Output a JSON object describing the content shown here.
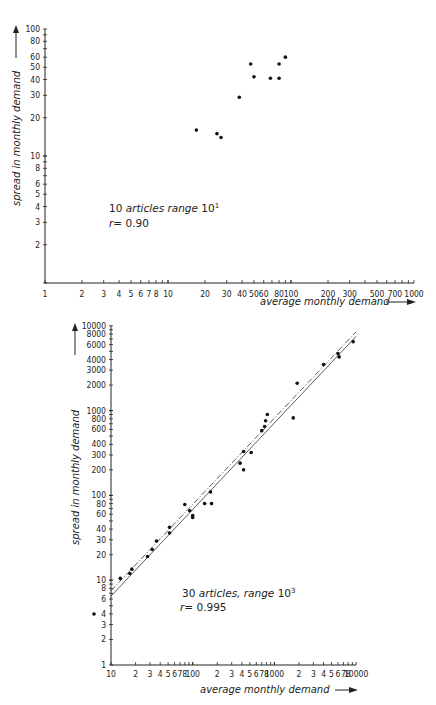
{
  "chart_data": [
    {
      "type": "scatter",
      "scale": "log-log",
      "xlabel": "average monthly demand",
      "ylabel": "spread in monthly demand",
      "xlim": [
        1,
        1000
      ],
      "ylim": [
        1,
        100
      ],
      "x_tick_labels": [
        "1",
        "2",
        "3",
        "4",
        "5",
        "6",
        "7",
        "8",
        "10",
        "20",
        "30",
        "40",
        "50",
        "60",
        "80",
        "100",
        "200",
        "300",
        "500",
        "700",
        "1000"
      ],
      "y_tick_labels": [
        "2",
        "3",
        "4",
        "5",
        "6",
        "8",
        "10",
        "20",
        "30",
        "40",
        "50",
        "60",
        "80",
        "100"
      ],
      "annotation": {
        "count": "10",
        "articles_text": "articles range",
        "range": "10",
        "range_exp": "1",
        "r_label": "r",
        "r_value": "= 0.90"
      },
      "grid": false,
      "points": [
        {
          "x": 17,
          "y": 16
        },
        {
          "x": 25,
          "y": 15
        },
        {
          "x": 27,
          "y": 14
        },
        {
          "x": 38,
          "y": 29
        },
        {
          "x": 47,
          "y": 53
        },
        {
          "x": 50,
          "y": 42
        },
        {
          "x": 68,
          "y": 41
        },
        {
          "x": 80,
          "y": 41
        },
        {
          "x": 80,
          "y": 53
        },
        {
          "x": 90,
          "y": 60
        }
      ]
    },
    {
      "type": "scatter",
      "scale": "log-log",
      "xlabel": "average monthly demand",
      "ylabel": "spread in monthly demand",
      "xlim": [
        10,
        10000
      ],
      "ylim": [
        1,
        10000
      ],
      "x_tick_labels": [
        "10",
        "2",
        "3",
        "4",
        "5",
        "6",
        "7",
        "8",
        "100",
        "2",
        "3",
        "4",
        "5",
        "6",
        "7",
        "8",
        "1000",
        "2",
        "3",
        "4",
        "5",
        "6",
        "7",
        "8",
        "10000"
      ],
      "y_tick_labels": [
        "1",
        "2",
        "3",
        "4",
        "6",
        "8",
        "10",
        "20",
        "30",
        "40",
        "60",
        "80",
        "100",
        "200",
        "300",
        "400",
        "600",
        "800",
        "1000",
        "2000",
        "3000",
        "4000",
        "6000",
        "8000",
        "10000"
      ],
      "annotation": {
        "count": "30",
        "articles_text": "articles, range",
        "range": "10",
        "range_exp": "3",
        "r_label": "r",
        "r_value": "= 0.995"
      },
      "grid": false,
      "fit_lines": [
        {
          "style": "solid",
          "from": {
            "x": 10,
            "y": 6.5
          },
          "to": {
            "x": 10000,
            "y": 7500
          }
        },
        {
          "style": "dashed",
          "from": {
            "x": 10,
            "y": 7.5
          },
          "to": {
            "x": 10000,
            "y": 8500
          }
        }
      ],
      "points": [
        {
          "x": 6,
          "y": 4
        },
        {
          "x": 13,
          "y": 10.5
        },
        {
          "x": 17,
          "y": 12
        },
        {
          "x": 18,
          "y": 13.5
        },
        {
          "x": 28,
          "y": 19
        },
        {
          "x": 32,
          "y": 23
        },
        {
          "x": 36,
          "y": 29
        },
        {
          "x": 52,
          "y": 36
        },
        {
          "x": 52,
          "y": 42
        },
        {
          "x": 80,
          "y": 78
        },
        {
          "x": 92,
          "y": 66
        },
        {
          "x": 100,
          "y": 55
        },
        {
          "x": 100,
          "y": 58
        },
        {
          "x": 140,
          "y": 80
        },
        {
          "x": 170,
          "y": 80
        },
        {
          "x": 165,
          "y": 110
        },
        {
          "x": 380,
          "y": 240
        },
        {
          "x": 420,
          "y": 200
        },
        {
          "x": 420,
          "y": 330
        },
        {
          "x": 520,
          "y": 320
        },
        {
          "x": 700,
          "y": 580
        },
        {
          "x": 760,
          "y": 650
        },
        {
          "x": 780,
          "y": 760
        },
        {
          "x": 820,
          "y": 900
        },
        {
          "x": 1700,
          "y": 820
        },
        {
          "x": 1900,
          "y": 2100
        },
        {
          "x": 4000,
          "y": 3500
        },
        {
          "x": 6000,
          "y": 4700
        },
        {
          "x": 6200,
          "y": 4300
        },
        {
          "x": 9200,
          "y": 6500
        }
      ]
    }
  ],
  "top_chart": {
    "ylabel": "spread in monthly demand",
    "xlabel": "average monthly demand",
    "annotation_line1_count": "10",
    "annotation_line1_text": "articles range",
    "annotation_line1_base": "10",
    "annotation_line1_exp": "1",
    "annotation_line2_r": "r",
    "annotation_line2_val": "= 0.90"
  },
  "bottom_chart": {
    "ylabel": "spread in monthly demand",
    "xlabel": "average   monthly demand",
    "annotation_line1_count": "30",
    "annotation_line1_text": "articles, range",
    "annotation_line1_base": "10",
    "annotation_line1_exp": "3",
    "annotation_line2_r": "r",
    "annotation_line2_val": "= 0.995"
  }
}
